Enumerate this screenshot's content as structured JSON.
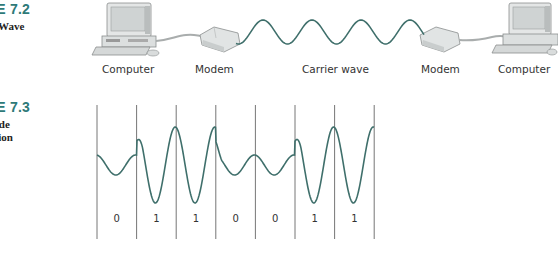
{
  "figures": [
    {
      "number": "RE 7.2",
      "caption_lines": [
        "er Wave"
      ]
    },
    {
      "number": "RE 7.3",
      "caption_lines": [
        "itude",
        "lation"
      ]
    }
  ],
  "carrier_diagram": {
    "labels": {
      "computer_left": "Computer",
      "modem_left": "Modem",
      "carrier_wave": "Carrier wave",
      "modem_right": "Modem",
      "computer_right": "Computer"
    },
    "wave_color": "#3f6f6b"
  },
  "am_diagram": {
    "bits": [
      "0",
      "1",
      "1",
      "0",
      "0",
      "1",
      "1"
    ],
    "wave_color": "#3f6f6b",
    "divider_color": "#666666"
  }
}
